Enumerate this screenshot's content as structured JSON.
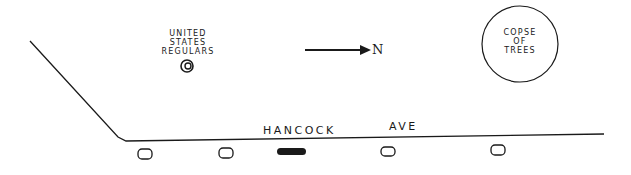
{
  "map": {
    "regulars_label": [
      "UNITED",
      "STATES",
      "REGULARS"
    ],
    "copse_label": [
      "COPSE",
      "OF",
      "TREES"
    ],
    "north_label": "N",
    "street_name_1": "HANCOCK",
    "street_name_2": "AVE",
    "markers": [
      {
        "type": "open-oval",
        "x": 145
      },
      {
        "type": "open-oval",
        "x": 225
      },
      {
        "type": "filled-oval",
        "x": 290
      },
      {
        "type": "open-oval",
        "x": 388
      },
      {
        "type": "open-oval",
        "x": 497
      }
    ],
    "line_color": "#1a1a1a"
  }
}
